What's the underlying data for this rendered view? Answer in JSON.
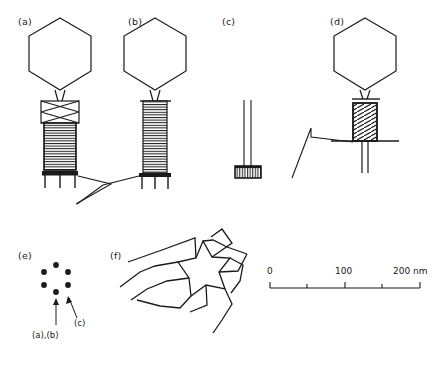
{
  "figure": {
    "type": "scientific-line-diagram",
    "background_color": "#ffffff",
    "stroke_color": "#1a1a1a"
  },
  "panels": [
    {
      "id": "a",
      "label": "(a)",
      "description": "Intact phage with extended tail sheath, collar, head, base plate and tail pins"
    },
    {
      "id": "b",
      "label": "(b)",
      "description": "Phage with extended striated tail sheath, base plate and one long kinked tail fiber"
    },
    {
      "id": "c",
      "label": "(c)",
      "description": "Isolated bare tail tube with hatched base plate"
    },
    {
      "id": "d",
      "label": "(d)",
      "description": "Phage with contracted tail sheath, tail tube penetrating base plate, kinked tail fiber"
    },
    {
      "id": "e",
      "label": "(e)",
      "description": "Cross-section end-on view: hexagonal ring of six subunits",
      "dots": 6,
      "annotations": [
        {
          "text": "(a),(b)",
          "points_to": "ring-center"
        },
        {
          "text": "(c)",
          "points_to": "ring-subunit"
        }
      ]
    },
    {
      "id": "f",
      "label": "(f)",
      "description": "Star-shaped six-armed pinwheel base plate viewed end-on"
    }
  ],
  "scale_bar": {
    "unit": "nm",
    "ticks": [
      {
        "value": "0",
        "labeled": true
      },
      {
        "value": "50",
        "labeled": false
      },
      {
        "value": "100",
        "labeled": true
      },
      {
        "value": "150",
        "labeled": false
      },
      {
        "value": "200",
        "labeled": true
      }
    ],
    "labels": [
      "0",
      "100",
      "200 nm"
    ],
    "range_min": 0,
    "range_max": 200
  }
}
